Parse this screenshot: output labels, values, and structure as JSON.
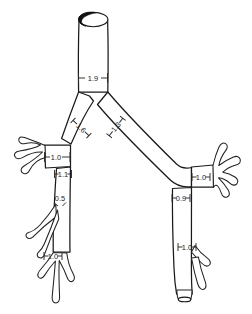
{
  "figure": {
    "kind": "anatomical-line-diagram",
    "background_color": "#ffffff",
    "line_color": "#1a1a1a",
    "label_color": "#232323",
    "lumen_shading_color": "#111111"
  },
  "measurements": [
    {
      "id": "trachea",
      "label": "1.9",
      "x": 93,
      "y": 78,
      "rotation": 0,
      "tick_half_width": 15,
      "tick_height": 5
    },
    {
      "id": "right-main-bronchus",
      "label": "1.6",
      "x": 81,
      "y": 128,
      "rotation": 44,
      "tick_half_width": 11,
      "tick_height": 4
    },
    {
      "id": "left-main-bronchus",
      "label": "1.3",
      "x": 116,
      "y": 127,
      "rotation": -52,
      "tick_half_width": 11,
      "tick_height": 4
    },
    {
      "id": "right-upper-lobe",
      "label": "1.0",
      "x": 56,
      "y": 157,
      "rotation": 0,
      "tick_half_width": 12,
      "tick_height": 4
    },
    {
      "id": "right-bronchus-inter",
      "label": "1.1",
      "x": 63,
      "y": 174,
      "rotation": 0,
      "tick_half_width": 9,
      "tick_height": 4
    },
    {
      "id": "right-middle-lobe",
      "label": "0.5",
      "x": 60,
      "y": 198,
      "rotation": 0,
      "tick_half_width": 5,
      "tick_height": 4
    },
    {
      "id": "right-lower-lobe",
      "label": "1.0",
      "x": 53,
      "y": 256,
      "rotation": 0,
      "tick_half_width": 9,
      "tick_height": 4
    },
    {
      "id": "left-upper-lobe",
      "label": "1.0",
      "x": 201,
      "y": 177,
      "rotation": 0,
      "tick_half_width": 9,
      "tick_height": 4
    },
    {
      "id": "left-bronchus-lower",
      "label": "0.9",
      "x": 181,
      "y": 198,
      "rotation": 0,
      "tick_half_width": 9,
      "tick_height": 4
    },
    {
      "id": "left-lower-lobe",
      "label": "1.0",
      "x": 187,
      "y": 247,
      "rotation": 0,
      "tick_half_width": 9,
      "tick_height": 4
    }
  ],
  "geometry": {
    "trachea_outline": "M 78,18 L 78,92 L 108,92 L 108,18 Z",
    "trachea_rim_ellipse": {
      "cx": 93,
      "cy": 18,
      "rx": 15,
      "ry": 7
    },
    "right_main_path": "M 78,92 L 60,140 L 68,146 L 92,104 Z",
    "left_main_path": "M 108,92 L 126,110 L 104,140 L 96,132 Z",
    "right_upper_trunk": "M 44,144 L 70,144 L 70,166 L 46,168 Z",
    "left_upper_trunk": "M 192,166 L 214,164 L 214,186 L 192,186 Z"
  }
}
